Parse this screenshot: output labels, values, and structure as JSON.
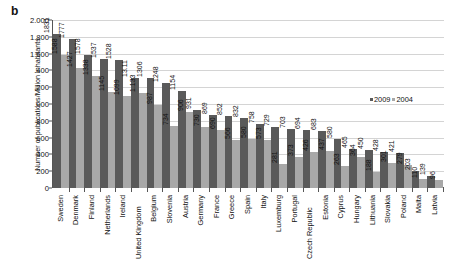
{
  "panel": {
    "label": "b"
  },
  "axes": {
    "ylabel": "Number of publications/Million inhabitants",
    "yticks": [
      "2.000",
      "1.800",
      "1.600",
      ".400",
      ".200",
      ".000",
      "800",
      "600",
      "400",
      "200",
      "0"
    ],
    "ylim_min": 0,
    "ylim_max": 2000,
    "ytick_step": 200
  },
  "legend": {
    "items": [
      {
        "label": "2009",
        "color": "#5a5a5a"
      },
      {
        "label": "2004",
        "color": "#a8a8a8"
      }
    ]
  },
  "chart_data": {
    "type": "bar",
    "title": "",
    "subtitle": "",
    "xlabel": "",
    "ylabel": "Number of publications/Million inhabitants",
    "ylim": [
      0,
      2000
    ],
    "ytick_step": 200,
    "grid": true,
    "legend_position": "inside-upper-right",
    "orientation": "vertical",
    "grouping": "grouped",
    "categories": [
      "Sweden",
      "Denmark",
      "Finland",
      "Netherlands",
      "Ireland",
      "United Kingdom",
      "Belgium",
      "Slovenia",
      "Austria",
      "Germany",
      "France",
      "Greece",
      "Spain",
      "Italy",
      "Luxemburg",
      "Portugal",
      "Czech Republic",
      "Estonia",
      "Cyprus",
      "Hungary",
      "Lithuania",
      "Slovakia",
      "Poland",
      "Malta",
      "Latvia"
    ],
    "series": [
      {
        "name": "2009",
        "color": "#5a5a5a",
        "values": [
          1831,
          1777,
          1578,
          1537,
          1528,
          1311,
          1306,
          1248,
          1154,
          931,
          869,
          852,
          832,
          758,
          729,
          703,
          694,
          683,
          580,
          465,
          450,
          428,
          421,
          203,
          139
        ]
      },
      {
        "name": "2004",
        "color": "#a8a8a8",
        "values": [
          1588,
          1427,
          1338,
          1145,
          1099,
          1133,
          987,
          734,
          906,
          730,
          690,
          566,
          580,
          573,
          281,
          373,
          426,
          437,
          263,
          364,
          188,
          301,
          279,
          110,
          96
        ]
      }
    ],
    "value_labels": [
      [
        "1831",
        "1588"
      ],
      [
        "1777",
        "1427"
      ],
      [
        "1578",
        "1338"
      ],
      [
        "1537",
        "1145"
      ],
      [
        "1528",
        "1099"
      ],
      [
        "13.11",
        "1.133"
      ],
      [
        "1306",
        "987"
      ],
      [
        "1248",
        "734"
      ],
      [
        "1154",
        "906"
      ],
      [
        "931",
        "730"
      ],
      [
        "869",
        "690"
      ],
      [
        "852",
        "566"
      ],
      [
        "832",
        "580"
      ],
      [
        "758",
        "573"
      ],
      [
        "729",
        "281"
      ],
      [
        "703",
        "373"
      ],
      [
        "694",
        "426"
      ],
      [
        "683",
        "437"
      ],
      [
        "580",
        "263"
      ],
      [
        "465",
        "364"
      ],
      [
        "450",
        "188"
      ],
      [
        "428",
        "301"
      ],
      [
        "421",
        "279"
      ],
      [
        "203",
        "110"
      ],
      [
        "139",
        "96"
      ]
    ]
  }
}
